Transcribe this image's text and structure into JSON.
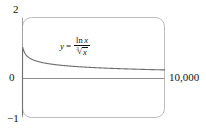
{
  "figure": {
    "name": "graph-of-ln-x-over-cube-root-x",
    "type": "calculator-viewport-plot"
  },
  "labels": {
    "y_top": "2",
    "y_zero": "0",
    "y_bottom": "−1",
    "x_right": "10,000"
  },
  "equation": {
    "lhs": "y",
    "equals": "=",
    "numerator_function": "ln",
    "numerator_variable": "x",
    "root_index": "3",
    "radical_sign": "√",
    "radicand": "x",
    "plain_text": "y = ln x / ∛ x"
  },
  "colors": {
    "frame": "#b9b9b9",
    "axis": "#9a9a9a",
    "curve": "#6e6e6e",
    "text": "#111111",
    "background": "#ffffff"
  },
  "chart_data": {
    "type": "line",
    "title": "",
    "xlabel": "",
    "ylabel": "",
    "xlim": [
      0,
      10000
    ],
    "ylim": [
      -1,
      2
    ],
    "grid": false,
    "legend": "none",
    "annotations": [
      {
        "text": "y = ln x / ∛ x",
        "x": 2600,
        "y": 1.35
      }
    ],
    "tick_labels": {
      "y": [
        "2",
        "0",
        "−1"
      ],
      "x": [
        "10,000"
      ]
    },
    "series": [
      {
        "name": "y = ln(x)/cbrt(x)",
        "x": [
          1,
          3,
          10,
          20,
          40,
          80,
          150,
          300,
          600,
          1000,
          1600,
          2500,
          4000,
          6000,
          8000,
          10000
        ],
        "y": [
          0.0,
          0.762,
          1.068,
          1.104,
          1.079,
          1.014,
          0.948,
          0.853,
          0.76,
          0.691,
          0.632,
          0.575,
          0.515,
          0.468,
          0.435,
          0.414
        ]
      }
    ]
  }
}
